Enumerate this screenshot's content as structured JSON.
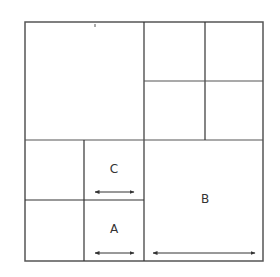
{
  "diagram": {
    "type": "nested-square-subdivision",
    "stroke_color": "#333333",
    "outer_square": {
      "x": 25,
      "y": 22,
      "size": 238
    },
    "cells": [
      {
        "id": "top-left",
        "label": ""
      },
      {
        "id": "top-right-q1",
        "label": ""
      },
      {
        "id": "top-right-q2",
        "label": ""
      },
      {
        "id": "top-right-q3",
        "label": ""
      },
      {
        "id": "top-right-q4",
        "label": ""
      },
      {
        "id": "bottom-left-q1",
        "label": ""
      },
      {
        "id": "bottom-left-q2",
        "label": "C"
      },
      {
        "id": "bottom-left-q3",
        "label": ""
      },
      {
        "id": "bottom-left-q4",
        "label": "A"
      },
      {
        "id": "bottom-right",
        "label": "B"
      }
    ],
    "labels": {
      "c": "C",
      "a": "A",
      "b": "B"
    },
    "arrows": [
      {
        "cell": "C",
        "kind": "double-headed horizontal width marker"
      },
      {
        "cell": "A",
        "kind": "double-headed horizontal width marker"
      },
      {
        "cell": "B",
        "kind": "double-headed horizontal width marker"
      }
    ]
  }
}
